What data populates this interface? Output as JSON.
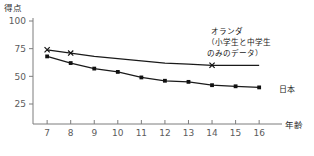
{
  "chart_data": {
    "type": "line",
    "title": "",
    "xlabel": "年齢",
    "ylabel": "得点",
    "x": [
      7,
      8,
      9,
      10,
      11,
      12,
      13,
      14,
      15,
      16
    ],
    "xtick_labels": [
      "7",
      "8",
      "9",
      "10",
      "11",
      "12",
      "13",
      "14",
      "15",
      "16"
    ],
    "xlim": [
      6.4,
      16.8
    ],
    "ylim": [
      0,
      100
    ],
    "ytick_labels": [
      "100",
      "75",
      "50",
      "25"
    ],
    "yticks": [
      100,
      75,
      50,
      25
    ],
    "grid": false,
    "legend_position": "inline-right",
    "series": [
      {
        "name": "オランダ",
        "marker": "x",
        "values": [
          74,
          71,
          68,
          66,
          64,
          62,
          61,
          60,
          60,
          60
        ],
        "marker_points": [
          {
            "x": 7,
            "y": 74
          },
          {
            "x": 8,
            "y": 71
          },
          {
            "x": 14,
            "y": 60
          }
        ],
        "color": "#1a1a1a"
      },
      {
        "name": "日本",
        "marker": "square",
        "values": [
          68,
          62,
          57,
          54,
          49,
          46,
          45,
          42,
          41,
          40
        ],
        "marker_points": [
          {
            "x": 7,
            "y": 68
          },
          {
            "x": 8,
            "y": 62
          },
          {
            "x": 9,
            "y": 57
          },
          {
            "x": 10,
            "y": 54
          },
          {
            "x": 11,
            "y": 49
          },
          {
            "x": 12,
            "y": 46
          },
          {
            "x": 13,
            "y": 45
          },
          {
            "x": 14,
            "y": 42
          },
          {
            "x": 15,
            "y": 41
          },
          {
            "x": 16,
            "y": 40
          }
        ],
        "color": "#1a1a1a"
      }
    ],
    "annotations": [
      {
        "id": "netherlands-note",
        "lines": [
          "オランダ",
          "（小学生と中学生",
          "のみのデータ）"
        ]
      },
      {
        "id": "japan-label",
        "lines": [
          "日本"
        ]
      }
    ]
  }
}
